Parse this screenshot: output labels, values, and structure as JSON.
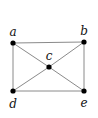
{
  "diagram": {
    "type": "graph",
    "directed": false,
    "nodes": [
      {
        "id": "a",
        "label": "a",
        "x": 13,
        "y": 43,
        "lx": 13,
        "ly": 36
      },
      {
        "id": "b",
        "label": "b",
        "x": 84,
        "y": 42,
        "lx": 84,
        "ly": 35
      },
      {
        "id": "c",
        "label": "c",
        "x": 49,
        "y": 67,
        "lx": 49,
        "ly": 60
      },
      {
        "id": "d",
        "label": "d",
        "x": 13,
        "y": 91,
        "lx": 13,
        "ly": 108
      },
      {
        "id": "e",
        "label": "e",
        "x": 84,
        "y": 91,
        "lx": 84,
        "ly": 107
      }
    ],
    "edges": [
      [
        "a",
        "b"
      ],
      [
        "a",
        "d"
      ],
      [
        "b",
        "e"
      ],
      [
        "d",
        "e"
      ],
      [
        "a",
        "c"
      ],
      [
        "c",
        "e"
      ],
      [
        "b",
        "c"
      ],
      [
        "c",
        "d"
      ]
    ],
    "colors": {
      "edge": "#8a8a8a",
      "node": "#000000",
      "label": "#111111",
      "background": "#ffffff"
    }
  }
}
